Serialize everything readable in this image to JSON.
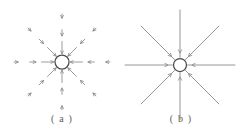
{
  "figure": {
    "width": 243,
    "height": 136,
    "background_color": "#ffffff",
    "line_color": "#8a8a8a",
    "circle_stroke_color": "#4a4a4a",
    "caption_color": "#5c5c5c"
  },
  "panels": [
    {
      "id": "a",
      "caption": "( a )",
      "style": "dashed-segmented-arrows",
      "description": "Eight inward-pointing dashed arrow chains converging on a small open circle",
      "center": {
        "x": 62,
        "y": 62
      },
      "circle_radius": 7.0,
      "ray_count": 8,
      "ray_angles_deg": [
        0,
        45,
        90,
        135,
        180,
        225,
        270,
        315
      ],
      "ray_length": 56,
      "segments_per_ray": 3,
      "arrow_direction": "inward"
    },
    {
      "id": "b",
      "caption": "( b )",
      "style": "solid-continuous-lines",
      "description": "Eight solid lines radiating from a small open circle with single inward arrowheads near the circle",
      "center": {
        "x": 180,
        "y": 65
      },
      "circle_radius": 6.5,
      "ray_count": 8,
      "ray_angles_deg": [
        0,
        45,
        90,
        135,
        180,
        225,
        270,
        315
      ],
      "ray_length": 55,
      "segments_per_ray": 1,
      "arrow_direction": "inward"
    }
  ]
}
